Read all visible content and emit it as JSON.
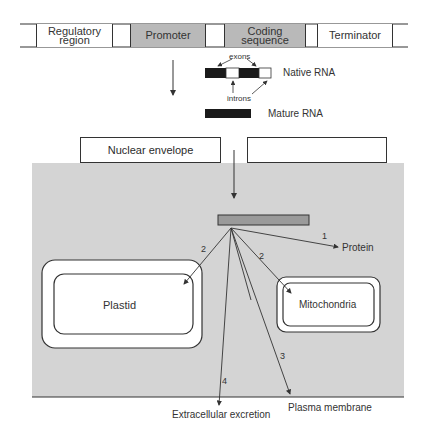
{
  "gene": {
    "segments": [
      {
        "label_line1": "Regulatory",
        "label_line2": "region",
        "fill": "white"
      },
      {
        "label_line1": "Promoter",
        "label_line2": "",
        "fill": "grey"
      },
      {
        "label_line1": "Coding",
        "label_line2": "sequence",
        "fill": "grey"
      },
      {
        "label_line1": "Terminator",
        "label_line2": "",
        "fill": "white"
      }
    ]
  },
  "rna": {
    "exons_label": "exons",
    "introns_label": "introns",
    "native_label": "Native RNA",
    "mature_label": "Mature RNA"
  },
  "nucleus": {
    "envelope_label": "Nuclear envelope"
  },
  "cell": {
    "plastid_label": "Plastid",
    "mitochondria_label": "Mitochondria",
    "protein_label": "Protein",
    "plasma_membrane_label": "Plasma membrane",
    "extracellular_label": "Extracellular excretion",
    "routes": [
      {
        "number": "1",
        "target": "Protein"
      },
      {
        "number": "2",
        "target": "Plastid"
      },
      {
        "number": "2",
        "target": "Mitochondria"
      },
      {
        "number": "3",
        "target": "Plasma membrane"
      },
      {
        "number": "4",
        "target": "Extracellular excretion"
      }
    ]
  },
  "colors": {
    "cytoplasm": "#d4d4d4",
    "gene_grey": "#b9b9b9",
    "rna_black": "#1a1a1a",
    "ribosome": "#9a9a9a",
    "line": "#333333"
  }
}
